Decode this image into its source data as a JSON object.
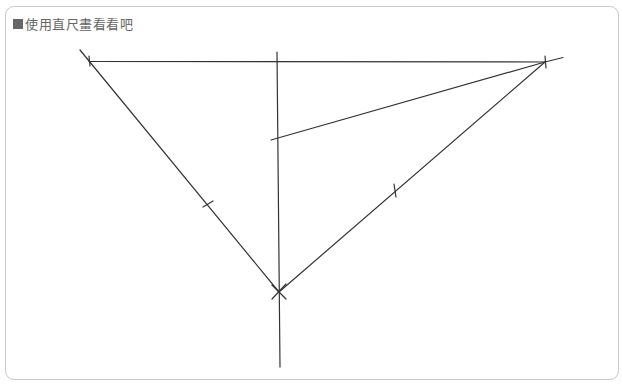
{
  "title": {
    "bullet_icon": "square-bullet-icon",
    "text": "使用直尺畫看看吧"
  },
  "colors": {
    "frame_border": "#c8c8c8",
    "title_text": "#666666",
    "line": "#333333",
    "background": "#ffffff"
  },
  "drawing": {
    "description": "Hand-drawn triangle construction with a vertical line, top horizontal base, and a slanted line from the vertical line to the top-right vertex; equal-length tick marks on the two lower sides.",
    "vertices": {
      "top_left": [
        89,
        61
      ],
      "top_right": [
        545,
        62
      ],
      "bottom": [
        279,
        292
      ]
    },
    "segments": [
      {
        "name": "top-side",
        "from": [
          89,
          61
        ],
        "to": [
          563,
          58
        ]
      },
      {
        "name": "left-side",
        "from": [
          80,
          50
        ],
        "to": [
          279,
          292
        ]
      },
      {
        "name": "right-side",
        "from": [
          545,
          62
        ],
        "to": [
          279,
          292
        ]
      },
      {
        "name": "vertical-line",
        "from": [
          277,
          52
        ],
        "to": [
          280,
          367
        ]
      },
      {
        "name": "slanted-line",
        "from": [
          271,
          140
        ],
        "to": [
          545,
          62
        ]
      }
    ],
    "tick_marks": [
      {
        "name": "left-side-tick",
        "at": [
          208,
          204
        ]
      },
      {
        "name": "right-side-tick",
        "at": [
          395,
          190
        ]
      }
    ]
  }
}
